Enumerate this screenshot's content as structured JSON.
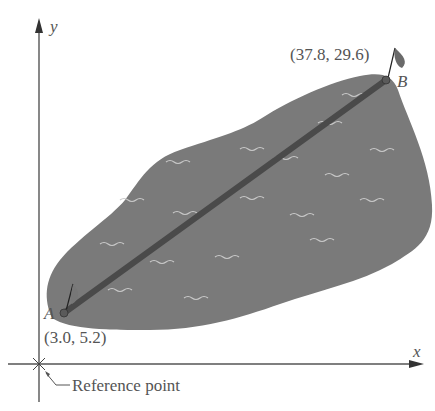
{
  "axes": {
    "x_label": "x",
    "y_label": "y"
  },
  "points": {
    "A": {
      "label": "A",
      "coords_text": "(3.0, 5.2)",
      "x": 3.0,
      "y": 5.2
    },
    "B": {
      "label": "B",
      "coords_text": "(37.8, 29.6)",
      "x": 37.8,
      "y": 29.6
    }
  },
  "reference": {
    "label": "Reference point"
  },
  "colors": {
    "lake": "#7a7a7a",
    "line": "#4a4a4a",
    "axis": "#555555",
    "text": "#555555",
    "wave": "#c8c8c8"
  }
}
